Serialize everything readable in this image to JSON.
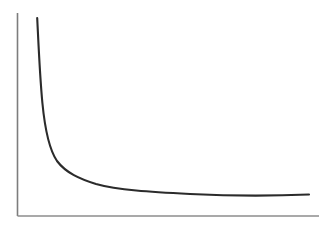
{
  "figure": {
    "name": "decay-curve-figure",
    "background_color": "#ffffff",
    "width": 330,
    "height": 226,
    "title": "",
    "appearance": "scanned line drawing, no text labels or tick marks"
  },
  "axes": {
    "y_axis": {
      "name": "y-axis-line",
      "color": "#7d7d7d",
      "stroke_width": 1.6,
      "x": 17.5,
      "y_top": 13,
      "y_bottom": 216
    },
    "x_axis": {
      "name": "x-axis-line",
      "color": "#8c8c8c",
      "stroke_width": 1.4,
      "y": 216,
      "x_left": 17.5,
      "x_right": 319
    }
  },
  "curve": {
    "name": "decay-curve",
    "color": "#2b2b2b",
    "stroke_width": 2.1,
    "path": "M 37.2 18 C 38.6 46, 39.8 76, 42.4 103 C 45.0 130, 49.5 150, 57 161 C 66 173, 80 179, 96 184 C 118 190, 150 192, 190 194 C 230 196, 275 196, 309 194.5"
  },
  "chart_data": {
    "type": "line",
    "title": "",
    "subtitle": "",
    "xlabel": "",
    "ylabel": "",
    "grid": false,
    "legend": null,
    "tick_labels_x": [],
    "tick_labels_y": [],
    "xlim": [
      0,
      1
    ],
    "ylim": [
      0,
      1
    ],
    "series": [
      {
        "name": "decay",
        "description": "monotonically decreasing convex hyperbolic decay curve approaching a horizontal asymptote",
        "x": [
          0.065,
          0.075,
          0.085,
          0.1,
          0.12,
          0.15,
          0.19,
          0.24,
          0.3,
          0.37,
          0.45,
          0.53,
          0.62,
          0.7,
          0.79,
          0.87,
          0.93,
          0.97
        ],
        "y": [
          0.975,
          0.84,
          0.72,
          0.58,
          0.45,
          0.34,
          0.265,
          0.215,
          0.18,
          0.16,
          0.145,
          0.135,
          0.128,
          0.122,
          0.117,
          0.113,
          0.11,
          0.108
        ]
      }
    ],
    "pixel_points": [
      {
        "x": 37,
        "y": 18
      },
      {
        "x": 39,
        "y": 45
      },
      {
        "x": 41,
        "y": 72
      },
      {
        "x": 43,
        "y": 100
      },
      {
        "x": 47,
        "y": 128
      },
      {
        "x": 53,
        "y": 152
      },
      {
        "x": 62,
        "y": 166
      },
      {
        "x": 76,
        "y": 175
      },
      {
        "x": 96,
        "y": 182
      },
      {
        "x": 120,
        "y": 186
      },
      {
        "x": 150,
        "y": 189
      },
      {
        "x": 185,
        "y": 191
      },
      {
        "x": 220,
        "y": 192
      },
      {
        "x": 255,
        "y": 193
      },
      {
        "x": 285,
        "y": 194
      },
      {
        "x": 309,
        "y": 194
      }
    ]
  }
}
